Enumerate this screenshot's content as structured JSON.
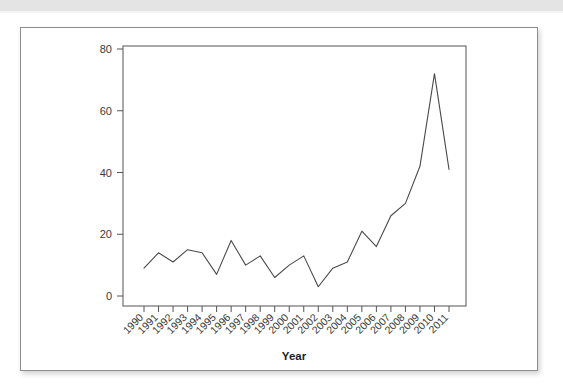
{
  "page": {
    "background_color": "#ffffff",
    "top_band_color": "#e4e4e4"
  },
  "figure": {
    "border_color": "#8e8e8e",
    "background_color": "#ffffff"
  },
  "chart_data": {
    "type": "line",
    "title": "",
    "subtitle": "",
    "xlabel": "Year",
    "ylabel": "",
    "categories": [
      "1990",
      "1991",
      "1992",
      "1993",
      "1994",
      "1995",
      "1996",
      "1997",
      "1998",
      "1999",
      "2000",
      "2001",
      "2002",
      "2003",
      "2004",
      "2005",
      "2006",
      "2007",
      "2008",
      "2009",
      "2010",
      "2011"
    ],
    "values": [
      9,
      14,
      11,
      15,
      14,
      7,
      18,
      10,
      13,
      6,
      10,
      13,
      3,
      9,
      11,
      21,
      16,
      26,
      30,
      42,
      72,
      41
    ],
    "series": [
      {
        "name": "count",
        "values": [
          9,
          14,
          11,
          15,
          14,
          7,
          18,
          10,
          13,
          6,
          10,
          13,
          3,
          9,
          11,
          21,
          16,
          26,
          30,
          42,
          72,
          41
        ],
        "color": "#4a4a4a"
      }
    ],
    "ylim": [
      0,
      84
    ],
    "yticks": [
      0,
      20,
      40,
      60,
      80
    ],
    "ytick_labels": [
      "0",
      "20",
      "40",
      "60",
      "80"
    ],
    "xtick_labels": [
      "1990",
      "1991",
      "1992",
      "1993",
      "1994",
      "1995",
      "1996",
      "1997",
      "1998",
      "1999",
      "2000",
      "2001",
      "2002",
      "2003",
      "2004",
      "2005",
      "2006",
      "2007",
      "2008",
      "2009",
      "2010",
      "2011"
    ],
    "xtick_rotation_deg": -45,
    "grid": false,
    "legend": null,
    "line_color": "#4a4a4a",
    "axis_color": "#555555",
    "markers": false,
    "annotations": []
  }
}
